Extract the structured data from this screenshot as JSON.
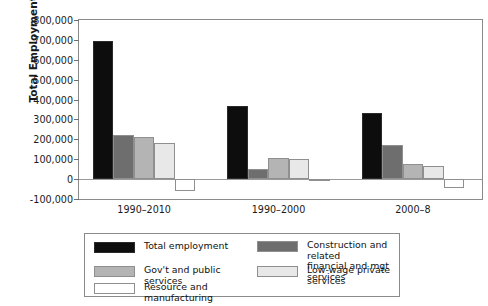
{
  "chart_data": {
    "type": "bar",
    "title": "",
    "xlabel": "",
    "ylabel": "Total Employment Growth",
    "categories": [
      "1990–2010",
      "1990–2000",
      "2000–8"
    ],
    "ylim": [
      -100000,
      800000
    ],
    "ytick_values": [
      800000,
      700000,
      600000,
      500000,
      400000,
      300000,
      200000,
      100000,
      0,
      -100000
    ],
    "ytick_labels": [
      "800,000",
      "700,000",
      "600,000",
      "500,000",
      "400,000",
      "300,000",
      "200,000",
      "100,000",
      "0",
      "-100,000"
    ],
    "grid": false,
    "legend_position": "below-plot",
    "series": [
      {
        "name": "Total employment",
        "color": "#0d0d0d",
        "values": [
          695000,
          368000,
          330000
        ]
      },
      {
        "name": "Construction and related\nfinancial and mgt services",
        "color": "#6e6e6e",
        "values": [
          220000,
          50000,
          172000
        ]
      },
      {
        "name": "Gov't and public services",
        "color": "#b4b4b4",
        "values": [
          212000,
          105000,
          75000
        ]
      },
      {
        "name": "Low-wage private services",
        "color": "#e8e8e8",
        "values": [
          180000,
          100000,
          65000
        ]
      },
      {
        "name": "Resource and manufacturing",
        "color": "#ffffff",
        "values": [
          -60000,
          -10000,
          -45000
        ]
      }
    ]
  },
  "legend": {
    "entries": [
      {
        "label": "Total employment",
        "color": "#0d0d0d"
      },
      {
        "label": "Construction and related\nfinancial and mgt services",
        "color": "#6e6e6e"
      },
      {
        "label": "Gov't and public services",
        "color": "#b4b4b4"
      },
      {
        "label": "Low-wage private services",
        "color": "#e8e8e8"
      },
      {
        "label": "Resource and manufacturing",
        "color": "#ffffff"
      }
    ]
  },
  "style": {
    "frame_color": "#8a8a8a",
    "bar_edge_color": "#8f8f8f",
    "text_color": "#1a1a1a"
  }
}
